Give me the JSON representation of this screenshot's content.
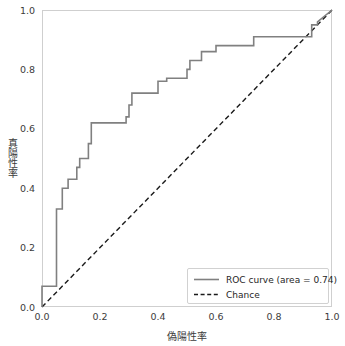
{
  "chart_data": {
    "type": "line",
    "title": "",
    "xlabel": "偽陽性率",
    "ylabel": "真陽性率",
    "xlim": [
      0.0,
      1.0
    ],
    "ylim": [
      0.0,
      1.0
    ],
    "grid": false,
    "legend_position": "lower right",
    "xticks": [
      "0.0",
      "0.2",
      "0.4",
      "0.6",
      "0.8",
      "1.0"
    ],
    "xtick_values": [
      0.0,
      0.2,
      0.4,
      0.6,
      0.8,
      1.0
    ],
    "yticks": [
      "0.0",
      "0.2",
      "0.4",
      "0.6",
      "0.8",
      "1.0"
    ],
    "ytick_values": [
      0.0,
      0.2,
      0.4,
      0.6,
      0.8,
      1.0
    ],
    "auc": 0.74,
    "series": [
      {
        "name": "ROC curve (area = 0.74)",
        "style": "step",
        "color": "#808080",
        "x": [
          0.0,
          0.0,
          0.05,
          0.05,
          0.05,
          0.07,
          0.07,
          0.09,
          0.09,
          0.12,
          0.12,
          0.13,
          0.13,
          0.16,
          0.16,
          0.17,
          0.17,
          0.29,
          0.29,
          0.3,
          0.3,
          0.31,
          0.31,
          0.4,
          0.4,
          0.43,
          0.43,
          0.5,
          0.5,
          0.51,
          0.51,
          0.55,
          0.55,
          0.6,
          0.6,
          0.73,
          0.73,
          0.93,
          0.93,
          0.95,
          0.95,
          1.0
        ],
        "y": [
          0.0,
          0.07,
          0.07,
          0.2,
          0.33,
          0.33,
          0.4,
          0.4,
          0.43,
          0.43,
          0.47,
          0.47,
          0.5,
          0.5,
          0.55,
          0.55,
          0.62,
          0.62,
          0.64,
          0.64,
          0.68,
          0.68,
          0.72,
          0.72,
          0.76,
          0.76,
          0.77,
          0.77,
          0.8,
          0.8,
          0.83,
          0.83,
          0.86,
          0.86,
          0.88,
          0.88,
          0.91,
          0.91,
          0.95,
          0.95,
          0.96,
          1.0
        ]
      },
      {
        "name": "Chance",
        "style": "dashed",
        "color": "#1a1a1a",
        "x": [
          0.0,
          1.0
        ],
        "y": [
          0.0,
          1.0
        ]
      }
    ]
  },
  "legend": {
    "entries": [
      {
        "label": "ROC curve (area = 0.74)"
      },
      {
        "label": "Chance"
      }
    ]
  },
  "axes": {
    "x_title": "偽陽性率",
    "y_title": "真陽性率",
    "x_ticks": [
      "0.0",
      "0.2",
      "0.4",
      "0.6",
      "0.8",
      "1.0"
    ],
    "y_ticks": [
      "0.0",
      "0.2",
      "0.4",
      "0.6",
      "0.8",
      "1.0"
    ]
  }
}
